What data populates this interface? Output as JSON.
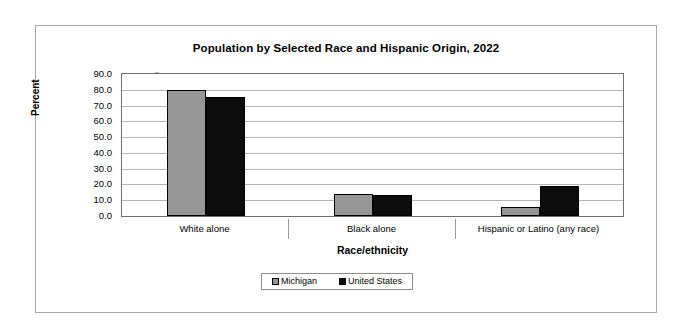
{
  "chart_data": {
    "type": "bar",
    "title": "Population by Selected Race and Hispanic Origin, 2022",
    "xlabel": "Race/ethnicity",
    "ylabel": "Percent",
    "categories": [
      "White alone",
      "Black alone",
      "Hispanic or Latino (any race)"
    ],
    "series": [
      {
        "name": "Michigan",
        "color": "#969696",
        "values": [
          79.9,
          13.7,
          5.6
        ]
      },
      {
        "name": "United States",
        "color": "#0d0d0d",
        "values": [
          75.5,
          13.6,
          19.1
        ]
      }
    ],
    "ylim": [
      0,
      90
    ],
    "yticks": [
      "0.0",
      "10.0",
      "20.0",
      "30.0",
      "40.0",
      "50.0",
      "60.0",
      "70.0",
      "80.0",
      "90.0"
    ],
    "ytick_values": [
      0,
      10,
      20,
      30,
      40,
      50,
      60,
      70,
      80,
      90
    ],
    "grid": true,
    "legend_position": "bottom"
  }
}
